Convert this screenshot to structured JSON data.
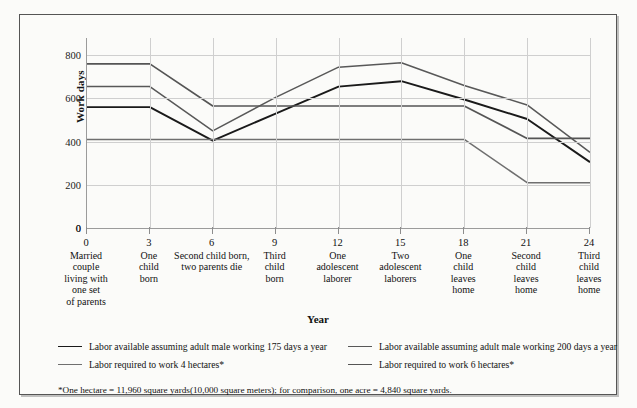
{
  "chart_data": {
    "type": "line",
    "title": "",
    "xlabel": "Year",
    "ylabel": "Work days",
    "ylim": [
      0,
      880
    ],
    "yticks": [
      0,
      200,
      400,
      600,
      800
    ],
    "grid": true,
    "legend_position": "bottom",
    "x": [
      0,
      3,
      6,
      9,
      12,
      15,
      18,
      21,
      24
    ],
    "categories": [
      {
        "year": "0",
        "desc": "Married\ncouple\nliving with\none set\nof parents"
      },
      {
        "year": "3",
        "desc": "One\nchild\nborn"
      },
      {
        "year": "6",
        "desc": "Second child born,\ntwo parents die"
      },
      {
        "year": "9",
        "desc": "Third\nchild\nborn"
      },
      {
        "year": "12",
        "desc": "One\nadolescent\nlaborer"
      },
      {
        "year": "15",
        "desc": "Two\nadolescent\nlaborers"
      },
      {
        "year": "18",
        "desc": "One\nchild\nleaves\nhome"
      },
      {
        "year": "21",
        "desc": "Second\nchild\nleaves\nhome"
      },
      {
        "year": "24",
        "desc": "Third\nchild\nleaves\nhome"
      }
    ],
    "series": [
      {
        "name": "Labor available assuming adult male working 175 days a year",
        "color": "#1a1a1a",
        "width": 1.9,
        "values": [
          560,
          560,
          405,
          530,
          655,
          680,
          595,
          505,
          305
        ]
      },
      {
        "name": "Labor available assuming adult male working 200 days a year",
        "color": "#585858",
        "width": 1.5,
        "values": [
          655,
          655,
          450,
          605,
          745,
          765,
          660,
          570,
          350
        ]
      },
      {
        "name": "Labor required to work 4 hectares*",
        "color": "#6f6f6f",
        "width": 1.5,
        "values": [
          410,
          410,
          410,
          410,
          410,
          410,
          410,
          210,
          210
        ]
      },
      {
        "name": "Labor required to work 6 hectares*",
        "color": "#555555",
        "width": 1.7,
        "values": [
          760,
          760,
          565,
          565,
          565,
          565,
          565,
          415,
          415
        ]
      }
    ],
    "footnote": "*One hectare = 11,960 square yards(10,000 square meters); for comparison, one acre = 4,840 square yards."
  }
}
